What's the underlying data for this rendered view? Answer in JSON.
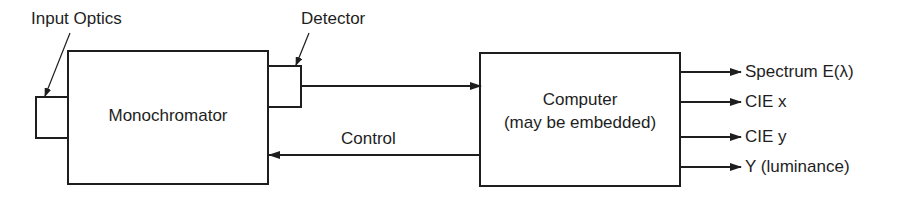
{
  "diagram": {
    "title": "",
    "colors": {
      "line": "#1e1e1e",
      "background": "#ffffff"
    },
    "blocks": {
      "input_optics": {
        "label": "Input Optics"
      },
      "monochromator": {
        "label": "Monochromator"
      },
      "detector": {
        "label": "Detector"
      },
      "computer": {
        "label_line1": "Computer",
        "label_line2": "(may be embedded)"
      }
    },
    "connections": {
      "detector_to_computer": {
        "label": ""
      },
      "control": {
        "label": "Control"
      }
    },
    "outputs": [
      {
        "label": "Spectrum E(λ)"
      },
      {
        "label": "CIE x"
      },
      {
        "label": "CIE y"
      },
      {
        "label": "Y (luminance)"
      }
    ]
  }
}
